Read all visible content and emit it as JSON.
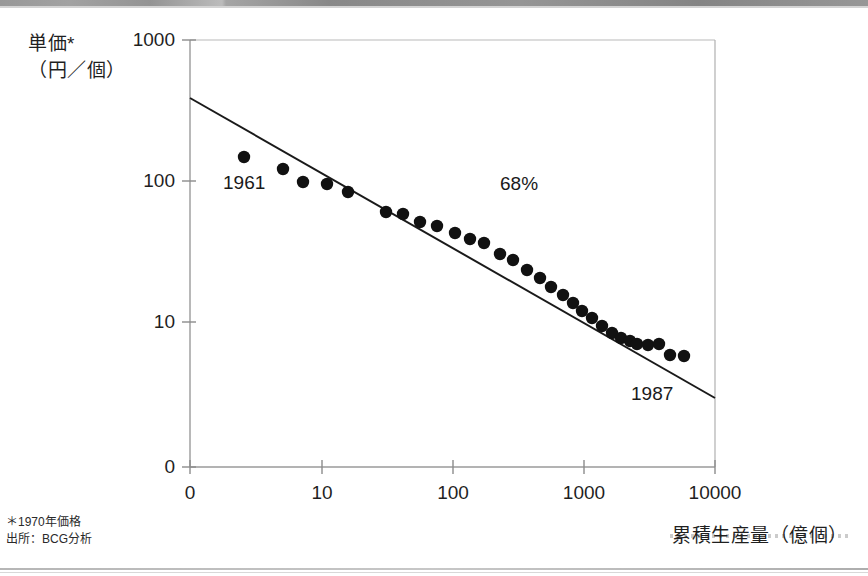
{
  "page": {
    "background": "#ffffff",
    "ink": "#1a1a1a"
  },
  "axis_titles": {
    "y_line1": "単価*",
    "y_line2": "（円／個）",
    "x": "累積生産量（億個）"
  },
  "footnotes": {
    "line1": "＊1970年価格",
    "line2": "出所：BCG分析"
  },
  "annotations": {
    "start_year": "1961",
    "slope_pct": "68%",
    "end_year": "1987"
  },
  "chart_data": {
    "type": "scatter",
    "title": "",
    "xlabel": "累積生産量（億個）",
    "ylabel": "単価*（円／個）",
    "xscale": "log",
    "yscale": "log",
    "grid": false,
    "legend": false,
    "xlim": [
      1,
      10000
    ],
    "ylim": [
      10,
      1000
    ],
    "xticks": [
      0,
      10,
      100,
      1000,
      10000
    ],
    "xtick_labels": [
      "0",
      "10",
      "100",
      "1000",
      "10000"
    ],
    "yticks": [
      0,
      10,
      100,
      1000
    ],
    "ytick_labels": [
      "0",
      "10",
      "100",
      "1000"
    ],
    "series": [
      {
        "name": "単価",
        "marker": "filled-circle",
        "color": "#111111",
        "points": [
          {
            "x": 3.0,
            "y": 140,
            "year": 1961
          },
          {
            "x": 7.6,
            "y": 120,
            "year": 1962
          },
          {
            "x": 11.5,
            "y": 104,
            "year": 1963
          },
          {
            "x": 18.0,
            "y": 98,
            "year": 1964
          },
          {
            "x": 26.0,
            "y": 88,
            "year": 1965
          },
          {
            "x": 42.0,
            "y": 70,
            "year": 1966
          },
          {
            "x": 55.0,
            "y": 68,
            "year": 1967
          },
          {
            "x": 72.0,
            "y": 62,
            "year": 1968
          },
          {
            "x": 95.0,
            "y": 56,
            "year": 1969
          },
          {
            "x": 125.0,
            "y": 52,
            "year": 1970
          },
          {
            "x": 155.0,
            "y": 48,
            "year": 1971
          },
          {
            "x": 190.0,
            "y": 44,
            "year": 1972
          },
          {
            "x": 240.0,
            "y": 38,
            "year": 1973
          },
          {
            "x": 290.0,
            "y": 34,
            "year": 1974
          },
          {
            "x": 350.0,
            "y": 30,
            "year": 1975
          },
          {
            "x": 420.0,
            "y": 27,
            "year": 1976
          },
          {
            "x": 500.0,
            "y": 24,
            "year": 1977
          },
          {
            "x": 590.0,
            "y": 21,
            "year": 1978
          },
          {
            "x": 690.0,
            "y": 19,
            "year": 1979
          },
          {
            "x": 800.0,
            "y": 17,
            "year": 1980
          },
          {
            "x": 930.0,
            "y": 15,
            "year": 1981
          },
          {
            "x": 1080.0,
            "y": 13,
            "year": 1982
          },
          {
            "x": 1250.0,
            "y": 11,
            "year": 1983
          },
          {
            "x": 1430.0,
            "y": 10,
            "year": 1984
          },
          {
            "x": 1650.0,
            "y": 9.5,
            "year": 1985
          },
          {
            "x": 1900.0,
            "y": 9.0,
            "year": 1986
          },
          {
            "x": 2200.0,
            "y": 8.6,
            "year": 1987
          },
          {
            "x": 2550.0,
            "y": 8.4,
            "year": 1988
          },
          {
            "x": 3000.0,
            "y": 7.3,
            "year": 1989
          },
          {
            "x": 3600.0,
            "y": 7.0,
            "year": 1990
          }
        ]
      }
    ],
    "trendline": {
      "name": "68% learning curve",
      "label": "68%",
      "color": "#1a1a1a",
      "from": {
        "x": 1,
        "y": 400
      },
      "to": {
        "x": 10000,
        "y": 5.0
      }
    }
  },
  "geometry": {
    "plot_left": 190,
    "plot_right": 715,
    "plot_top": 40,
    "plot_bottom": 467,
    "ytick_y": {
      "1000": 40,
      "100": 181,
      "10": 322,
      "0": 467
    },
    "xtick_x": {
      "0": 190,
      "10": 322,
      "100": 453,
      "1000": 584,
      "10000": 715
    },
    "trend_y_left": 98,
    "trend_y_right": 398,
    "marker_radius": 6.2,
    "points_px": [
      [
        244,
        157
      ],
      [
        283,
        169
      ],
      [
        303,
        182
      ],
      [
        327,
        184
      ],
      [
        348,
        192
      ],
      [
        386,
        212
      ],
      [
        403,
        214
      ],
      [
        420,
        222
      ],
      [
        437,
        226
      ],
      [
        455,
        233
      ],
      [
        470,
        239
      ],
      [
        484,
        243
      ],
      [
        500,
        254
      ],
      [
        513,
        260
      ],
      [
        527,
        270
      ],
      [
        540,
        278
      ],
      [
        551,
        287
      ],
      [
        563,
        295
      ],
      [
        573,
        303
      ],
      [
        582,
        311
      ],
      [
        592,
        318
      ],
      [
        602,
        326
      ],
      [
        612,
        333
      ],
      [
        621,
        338
      ],
      [
        630,
        341
      ],
      [
        637,
        344
      ],
      [
        648,
        345
      ],
      [
        659,
        344
      ],
      [
        670,
        355
      ],
      [
        684,
        356
      ]
    ]
  }
}
